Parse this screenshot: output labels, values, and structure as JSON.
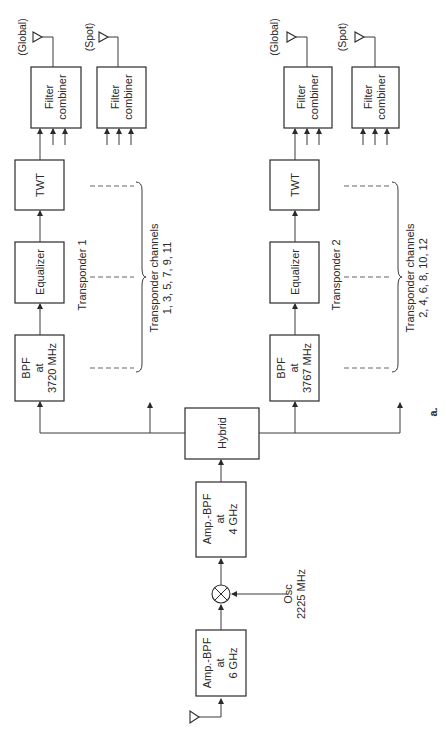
{
  "figure_label": "a.",
  "input": {
    "antenna": "antenna-input",
    "amp_6ghz": {
      "line1": "Amp.-BPF",
      "line2": "at",
      "line3": "6 GHz"
    },
    "mixer": "mixer",
    "osc": {
      "line1": "Osc",
      "line2": "2225 MHz"
    },
    "amp_4ghz": {
      "line1": "Amp.-BPF",
      "line2": "at",
      "line3": "4 GHz"
    },
    "hybrid": "Hybrid"
  },
  "transponder1": {
    "label": "Transponder 1",
    "bpf": {
      "line1": "BPF",
      "line2": "at",
      "line3": "3720 MHz"
    },
    "equalizer": "Equalizer",
    "twt": "TWT",
    "channels": {
      "line1": "Transponder channels",
      "line2": "1, 3, 5, 7, 9, 11"
    },
    "global_combiner": {
      "line1": "Filter",
      "line2": "combiner",
      "antenna_label": "(Global)"
    },
    "spot_combiner": {
      "line1": "Filter",
      "line2": "combiner",
      "antenna_label": "(Spot)"
    }
  },
  "transponder2": {
    "label": "Transponder 2",
    "bpf": {
      "line1": "BPF",
      "line2": "at",
      "line3": "3767 MHz"
    },
    "equalizer": "Equalizer",
    "twt": "TWT",
    "channels": {
      "line1": "Transponder channels",
      "line2": "2, 4, 6, 8, 10, 12"
    },
    "global_combiner": {
      "line1": "Filter",
      "line2": "combiner",
      "antenna_label": "(Global)"
    },
    "spot_combiner": {
      "line1": "Filter",
      "line2": "combiner",
      "antenna_label": "(Spot)"
    }
  }
}
